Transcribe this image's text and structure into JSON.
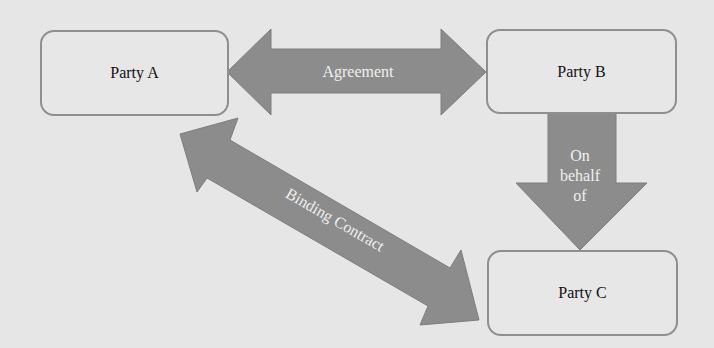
{
  "diagram": {
    "nodes": [
      {
        "id": "party-a",
        "label": "Party A"
      },
      {
        "id": "party-b",
        "label": "Party B"
      },
      {
        "id": "party-c",
        "label": "Party C"
      }
    ],
    "edges": [
      {
        "from": "party-a",
        "to": "party-b",
        "label": "Agreement",
        "direction": "both"
      },
      {
        "from": "party-b",
        "to": "party-c",
        "label_lines": [
          "On",
          "behalf",
          "of"
        ],
        "direction": "forward"
      },
      {
        "from": "party-a",
        "to": "party-c",
        "label": "Binding Contract",
        "direction": "both"
      }
    ]
  },
  "colors": {
    "background": "#e6e6e6",
    "box_fill": "#e7e7e7",
    "box_border": "#8f8f8f",
    "arrow_fill": "#8c8c8c",
    "arrow_text": "#f0f0f0"
  }
}
